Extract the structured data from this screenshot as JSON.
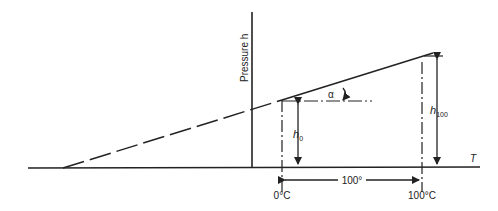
{
  "diagram": {
    "type": "pressure-temperature line diagram",
    "labels": {
      "y_axis": "Pressure h",
      "x_axis": "T",
      "angle": "α",
      "h0": "h",
      "h0_sub": "0",
      "h100": "h",
      "h100_sub": "100",
      "span": "100°",
      "t0": "0°C",
      "t100": "100°C"
    },
    "colors": {
      "line": "#222222",
      "background": "#ffffff"
    }
  }
}
